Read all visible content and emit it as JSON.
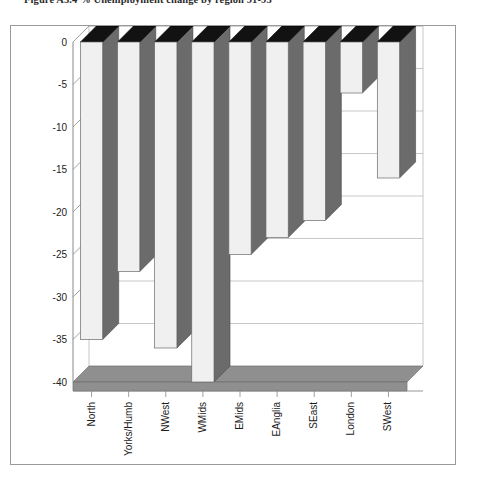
{
  "caption": {
    "text": "Figure A3.4   % Unemployment change by region 91-93"
  },
  "chart_data": {
    "type": "bar",
    "title": "",
    "subtitle": "",
    "xlabel": "",
    "ylabel": "",
    "categories": [
      "North",
      "Yorks/Humb",
      "NWest",
      "WMids",
      "EMids",
      "EAnglia",
      "SEast",
      "London",
      "SWest"
    ],
    "values": [
      -35,
      -27,
      -36,
      -40,
      -25,
      -23,
      -21,
      -6,
      -16
    ],
    "series": [
      {
        "name": "% unemployment change",
        "values": [
          -35,
          -27,
          -36,
          -40,
          -25,
          -23,
          -21,
          -6,
          -16
        ]
      }
    ],
    "ylim": [
      -40,
      0
    ],
    "yticks": [
      0,
      -5,
      -10,
      -15,
      -20,
      -25,
      -30,
      -35,
      -40
    ],
    "ytick_labels": [
      "0",
      "-5",
      "-10",
      "-15",
      "-20",
      "-25",
      "-30",
      "-35",
      "-40"
    ],
    "grid": true,
    "grid_axis": "y",
    "legend": false,
    "legend_position": "none",
    "style": "3d-column",
    "bar_front_color": "#f0f0f0",
    "bar_side_color": "#6b6b6b",
    "bar_top_color": "#121212",
    "grid_color": "#b9b9b9",
    "axis_color": "#8a8a8a",
    "floor_color": "#8f8f8f",
    "frame_color": "#9a9a9a",
    "category_label_rotation": -90
  }
}
